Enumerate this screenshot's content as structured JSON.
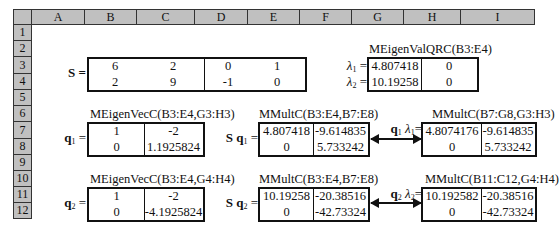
{
  "spreadsheet": {
    "columns": [
      "A",
      "B",
      "C",
      "D",
      "E",
      "F",
      "G",
      "H",
      "I"
    ],
    "rows": [
      "1",
      "2",
      "3",
      "4",
      "5",
      "6",
      "7",
      "8",
      "9",
      "10",
      "11",
      "12"
    ],
    "colors": {
      "header_bg": "#c0c0c0",
      "border": "#111111"
    }
  },
  "matrix_S": {
    "label": "S =",
    "values": [
      [
        "6",
        "2",
        "0",
        "1"
      ],
      [
        "2",
        "9",
        "-1",
        "0"
      ]
    ]
  },
  "eigenvalues": {
    "caption": "MEigenValQRC(B3:E4)",
    "labels": [
      "λ₁ =",
      "λ₂ ="
    ],
    "lambda_sym": "λ",
    "subs": [
      "1",
      "2"
    ],
    "values": [
      [
        "4.807418",
        "0"
      ],
      [
        "10.19258",
        "0"
      ]
    ]
  },
  "q1": {
    "caption": "MEigenVecC(B3:E4,G3:H3)",
    "label_bold": "q",
    "label_sub": "1",
    "label_eq": "=",
    "values": [
      [
        "1",
        "-2"
      ],
      [
        "0",
        "1.1925824"
      ]
    ]
  },
  "Sq1": {
    "caption": "MMultC(B3:E4,B7:E8)",
    "label_S": "S",
    "label_bold": "q",
    "label_sub": "1",
    "label_eq": "=",
    "values": [
      [
        "4.807418",
        "-9.614835"
      ],
      [
        "0",
        "5.733242"
      ]
    ]
  },
  "q1lambda1": {
    "caption": "MMultC(B7:G8,G3:H3)",
    "label_bold": "q",
    "label_sub": "1",
    "lambda_sym": "λ",
    "lambda_sub": "1",
    "label_eq": "=",
    "values": [
      [
        "4.8074176",
        "-9.614835"
      ],
      [
        "0",
        "5.733242"
      ]
    ]
  },
  "q2": {
    "caption": "MEigenVecC(B3:E4,G4:H4)",
    "label_bold": "q",
    "label_sub": "2",
    "label_eq": "=",
    "values": [
      [
        "1",
        "-2"
      ],
      [
        "0",
        "-4.1925824"
      ]
    ]
  },
  "Sq2": {
    "caption": "MMultC(B3:E4,B7:E8)",
    "label_S": "S",
    "label_bold": "q",
    "label_sub": "2",
    "label_eq": "=",
    "values": [
      [
        "10.19258",
        "-20.38516"
      ],
      [
        "0",
        "-42.73324"
      ]
    ]
  },
  "q2lambda2": {
    "caption": "MMultC(B11:C12,G4:H4)",
    "label_bold": "q",
    "label_sub": "2",
    "lambda_sym": "λ",
    "lambda_sub": "2",
    "label_eq": "=",
    "values": [
      [
        "10.192582",
        "-20.38516"
      ],
      [
        "0",
        "-42.73324"
      ]
    ]
  }
}
